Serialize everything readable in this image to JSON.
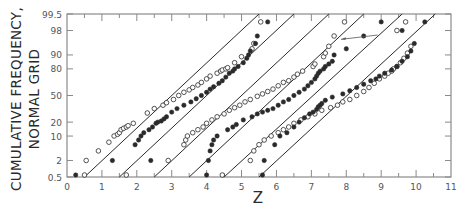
{
  "chart_data": {
    "type": "scatter",
    "title": "",
    "xlabel": "Z",
    "ylabel": "CUMULATIVE FREQUENCY, NORMAL GRID",
    "ylabel_lines": [
      "CUMULATIVE FREQUENCY,",
      "NORMAL GRID"
    ],
    "xlim": [
      0,
      11
    ],
    "ylim": [
      0.5,
      99.5
    ],
    "yscale": "normal-probability",
    "x_ticks": [
      0,
      1,
      2,
      3,
      4,
      5,
      6,
      7,
      8,
      9,
      10,
      11
    ],
    "x_minor_ticks": [
      0.5,
      1.5,
      2.5,
      3.5,
      4.5,
      5.5,
      6.5,
      7.5,
      8.5,
      9.5,
      10.5
    ],
    "y_ticks": [
      0.5,
      2,
      10,
      20,
      50,
      80,
      90,
      98,
      99.5
    ],
    "y_tick_labels": [
      "0.5",
      "2",
      "10",
      "20",
      "50",
      "80",
      "90",
      "98",
      "99.5"
    ],
    "grid": false,
    "legend": null,
    "fit_lines": [
      {
        "x0": 0.5,
        "x1": 5.5
      },
      {
        "x0": 1.5,
        "x1": 6.5
      },
      {
        "x0": 2.5,
        "x1": 7.5
      },
      {
        "x0": 3.5,
        "x1": 8.5
      },
      {
        "x0": 4.5,
        "x1": 9.6
      },
      {
        "x0": 5.5,
        "x1": 10.55
      }
    ],
    "series": [
      {
        "name": "series-1",
        "marker": "open",
        "points": [
          [
            0.5,
            0.6
          ],
          [
            0.55,
            2
          ],
          [
            0.9,
            4
          ],
          [
            1.2,
            7
          ],
          [
            1.35,
            10
          ],
          [
            1.45,
            11
          ],
          [
            1.5,
            12
          ],
          [
            1.55,
            14
          ],
          [
            1.62,
            15
          ],
          [
            1.7,
            16
          ],
          [
            1.75,
            17
          ],
          [
            1.9,
            19
          ],
          [
            2.3,
            29
          ],
          [
            2.5,
            34
          ],
          [
            2.75,
            38
          ],
          [
            2.85,
            41
          ],
          [
            3.05,
            45
          ],
          [
            3.2,
            50
          ],
          [
            3.35,
            54
          ],
          [
            3.5,
            57
          ],
          [
            3.6,
            60
          ],
          [
            3.75,
            63
          ],
          [
            3.85,
            66
          ],
          [
            4.0,
            70
          ],
          [
            4.1,
            73
          ],
          [
            4.3,
            76
          ],
          [
            4.4,
            78
          ],
          [
            4.45,
            79
          ],
          [
            4.55,
            80
          ],
          [
            4.6,
            81
          ],
          [
            4.8,
            85
          ],
          [
            5.0,
            89
          ],
          [
            5.3,
            93
          ],
          [
            5.35,
            95
          ],
          [
            5.55,
            99
          ]
        ]
      },
      {
        "name": "series-2",
        "marker": "filled",
        "points": [
          [
            0.25,
            0.6
          ],
          [
            1.3,
            2
          ],
          [
            1.95,
            6
          ],
          [
            2.05,
            8
          ],
          [
            2.12,
            10
          ],
          [
            2.2,
            12
          ],
          [
            2.35,
            14
          ],
          [
            2.45,
            16
          ],
          [
            2.55,
            19
          ],
          [
            2.6,
            20
          ],
          [
            2.7,
            21
          ],
          [
            2.78,
            23
          ],
          [
            2.85,
            25
          ],
          [
            3.0,
            30
          ],
          [
            3.15,
            34
          ],
          [
            3.35,
            38
          ],
          [
            3.55,
            42
          ],
          [
            3.7,
            46
          ],
          [
            3.85,
            50
          ],
          [
            4.0,
            54
          ],
          [
            4.1,
            58
          ],
          [
            4.2,
            61
          ],
          [
            4.35,
            65
          ],
          [
            4.45,
            68
          ],
          [
            4.55,
            72
          ],
          [
            4.65,
            76
          ],
          [
            4.75,
            78
          ],
          [
            4.8,
            80
          ],
          [
            4.9,
            82
          ],
          [
            5.05,
            85
          ],
          [
            5.15,
            88
          ],
          [
            5.2,
            90
          ],
          [
            5.25,
            92
          ],
          [
            5.4,
            95
          ],
          [
            5.45,
            97
          ],
          [
            5.75,
            99
          ]
        ]
      },
      {
        "name": "series-3",
        "marker": "open",
        "points": [
          [
            1.7,
            0.6
          ],
          [
            2.9,
            2
          ],
          [
            3.35,
            6
          ],
          [
            3.4,
            8
          ],
          [
            3.45,
            10
          ],
          [
            3.6,
            12
          ],
          [
            3.75,
            14
          ],
          [
            3.9,
            16
          ],
          [
            4.0,
            19
          ],
          [
            4.15,
            22
          ],
          [
            4.3,
            25
          ],
          [
            4.5,
            28
          ],
          [
            4.65,
            32
          ],
          [
            4.8,
            35
          ],
          [
            4.95,
            38
          ],
          [
            5.1,
            42
          ],
          [
            5.25,
            45
          ],
          [
            5.45,
            49
          ],
          [
            5.6,
            52
          ],
          [
            5.75,
            55
          ],
          [
            5.9,
            58
          ],
          [
            6.05,
            62
          ],
          [
            6.2,
            66
          ],
          [
            6.35,
            68
          ],
          [
            6.5,
            72
          ],
          [
            6.6,
            75
          ],
          [
            6.75,
            78
          ],
          [
            7.05,
            82
          ],
          [
            7.1,
            84
          ],
          [
            7.35,
            89
          ],
          [
            7.4,
            91
          ],
          [
            7.5,
            94
          ],
          [
            7.65,
            97
          ],
          [
            7.95,
            99
          ]
        ]
      },
      {
        "name": "series-4",
        "marker": "filled",
        "points": [
          [
            2.4,
            2
          ],
          [
            4.0,
            0.6
          ],
          [
            4.05,
            2
          ],
          [
            4.1,
            4
          ],
          [
            4.15,
            6
          ],
          [
            4.2,
            8
          ],
          [
            4.3,
            10
          ],
          [
            4.6,
            14
          ],
          [
            4.75,
            16
          ],
          [
            4.85,
            18
          ],
          [
            5.05,
            22
          ],
          [
            5.3,
            25
          ],
          [
            5.45,
            28
          ],
          [
            5.6,
            30
          ],
          [
            5.75,
            32
          ],
          [
            5.9,
            34
          ],
          [
            6.05,
            38
          ],
          [
            6.2,
            42
          ],
          [
            6.35,
            45
          ],
          [
            6.5,
            50
          ],
          [
            6.65,
            54
          ],
          [
            6.8,
            58
          ],
          [
            6.9,
            62
          ],
          [
            7.0,
            66
          ],
          [
            7.1,
            70
          ],
          [
            7.15,
            73
          ],
          [
            7.2,
            76
          ],
          [
            7.25,
            78
          ],
          [
            7.35,
            80
          ],
          [
            7.4,
            82
          ],
          [
            7.5,
            84
          ],
          [
            7.6,
            86
          ],
          [
            7.65,
            90
          ],
          [
            8.0,
            93
          ],
          [
            8.5,
            97
          ],
          [
            9.0,
            99
          ]
        ]
      },
      {
        "name": "series-5",
        "marker": "open",
        "points": [
          [
            4.45,
            0.6
          ],
          [
            5.25,
            2
          ],
          [
            5.35,
            4
          ],
          [
            5.5,
            6
          ],
          [
            5.65,
            8
          ],
          [
            5.85,
            10
          ],
          [
            6.05,
            12
          ],
          [
            6.2,
            14
          ],
          [
            6.35,
            16
          ],
          [
            6.5,
            19
          ],
          [
            6.7,
            22
          ],
          [
            6.9,
            25
          ],
          [
            7.1,
            28
          ],
          [
            7.3,
            32
          ],
          [
            7.55,
            35
          ],
          [
            7.75,
            38
          ],
          [
            7.9,
            42
          ],
          [
            8.1,
            45
          ],
          [
            8.3,
            50
          ],
          [
            8.5,
            55
          ],
          [
            8.65,
            60
          ],
          [
            8.8,
            65
          ],
          [
            8.95,
            70
          ],
          [
            9.1,
            73
          ],
          [
            9.2,
            76
          ],
          [
            9.3,
            78
          ],
          [
            9.35,
            80
          ],
          [
            9.45,
            82
          ],
          [
            9.55,
            85
          ],
          [
            9.65,
            88
          ],
          [
            9.75,
            91
          ],
          [
            9.85,
            94
          ],
          [
            9.45,
            98
          ],
          [
            9.7,
            99
          ]
        ]
      },
      {
        "name": "series-6",
        "marker": "filled",
        "points": [
          [
            5.6,
            0.6
          ],
          [
            5.65,
            2
          ],
          [
            5.95,
            6
          ],
          [
            6.1,
            10
          ],
          [
            6.3,
            12
          ],
          [
            6.5,
            16
          ],
          [
            6.65,
            20
          ],
          [
            6.8,
            24
          ],
          [
            6.95,
            28
          ],
          [
            7.05,
            30
          ],
          [
            7.15,
            33
          ],
          [
            7.2,
            36
          ],
          [
            7.25,
            38
          ],
          [
            7.3,
            40
          ],
          [
            7.4,
            44
          ],
          [
            7.6,
            48
          ],
          [
            7.9,
            52
          ],
          [
            8.1,
            56
          ],
          [
            8.3,
            60
          ],
          [
            8.5,
            64
          ],
          [
            8.7,
            68
          ],
          [
            8.85,
            70
          ],
          [
            8.95,
            73
          ],
          [
            9.1,
            76
          ],
          [
            9.3,
            79
          ],
          [
            9.45,
            82
          ],
          [
            9.6,
            86
          ],
          [
            9.75,
            89
          ],
          [
            9.85,
            92
          ],
          [
            9.95,
            95
          ],
          [
            9.6,
            98
          ],
          [
            10.25,
            99
          ]
        ]
      }
    ],
    "annotation": {
      "type": "arrow",
      "from": [
        8.9,
        97.2
      ],
      "to": [
        7.85,
        96.2
      ]
    }
  },
  "axis": {
    "x_label": "Z",
    "y_label_line1": "CUMULATIVE FREQUENCY,",
    "y_label_line2": "NORMAL GRID"
  },
  "colors": {
    "ink": "#2a2a2a",
    "axis": "#8a8a8a",
    "background": "#ffffff"
  }
}
